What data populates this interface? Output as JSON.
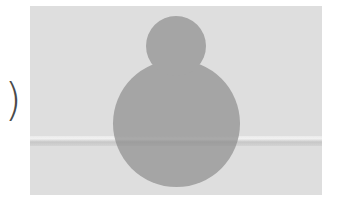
{
  "left_glyph": ")",
  "placeholder": {
    "type": "image-placeholder",
    "icon": "person-silhouette-icon",
    "colors": {
      "panel_background": "#dedede",
      "silhouette": "#a5a5a5",
      "glyph": "#4a4a4a"
    }
  }
}
